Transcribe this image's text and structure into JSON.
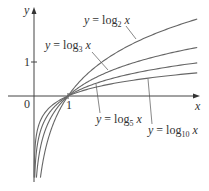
{
  "chart_data": {
    "type": "line",
    "title": "",
    "xlabel": "x",
    "ylabel": "y",
    "xlim": [
      -1,
      4.8
    ],
    "ylim": [
      -2.4,
      2.8
    ],
    "grid": false,
    "ticks": {
      "x": [
        {
          "value": 0,
          "label": "0"
        },
        {
          "value": 1,
          "label": "1"
        }
      ],
      "y": [
        {
          "value": 1,
          "label": "1"
        }
      ]
    },
    "series": [
      {
        "name": "y = log₂ x",
        "base": 2,
        "label_text": "y = log",
        "label_sub": "2",
        "label_var": "x"
      },
      {
        "name": "y = log₃ x",
        "base": 3,
        "label_text": "y = log",
        "label_sub": "3",
        "label_var": "x"
      },
      {
        "name": "y = log₅ x",
        "base": 5,
        "label_text": "y = log",
        "label_sub": "5",
        "label_var": "x"
      },
      {
        "name": "y = log₁₀ x",
        "base": 10,
        "label_text": "y = log",
        "label_sub": "10",
        "label_var": "x"
      }
    ],
    "annotations": "All curves pass through (1, 0); labels with leader lines point to each curve"
  },
  "axes": {
    "x_label": "x",
    "y_label": "y",
    "origin_label": "0",
    "x_tick_1": "1",
    "y_tick_1": "1"
  }
}
